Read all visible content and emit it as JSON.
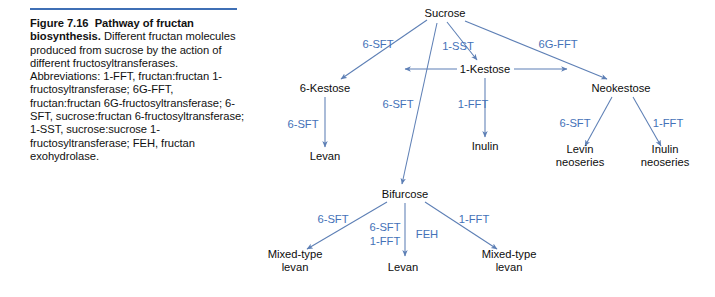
{
  "figure": {
    "rule_color": "#3f6fb5",
    "caption_label": "Figure 7.16",
    "caption_title": "Pathway of fructan biosynthesis.",
    "caption_body": " Different fructan molecules produced from sucrose by the action of different fructosyltransferases.\nAbbreviations: 1-FFT, fructan:fructan 1-fructosyltransferase; 6G-FFT, fructan:fructan 6G-fructosyltransferase; 6-SFT, sucrose:fructan 6-fructosyltransferase; 1-SST, sucrose:sucrose 1-fructosyltransferase; FEH, fructan exohydrolase."
  },
  "diagram": {
    "node_color": "#0d0d0d",
    "enzyme_color": "#4472b8",
    "arrow_color": "#5d7fb5",
    "nodes": [
      {
        "id": "sucrose",
        "label": "Sucrose",
        "x": 190,
        "y": 13
      },
      {
        "id": "six-kestose",
        "label": "6-Kestose",
        "x": 70,
        "y": 88
      },
      {
        "id": "one-kestose",
        "label": "1-Kestose",
        "x": 230,
        "y": 69
      },
      {
        "id": "neokestose",
        "label": "Neokestose",
        "x": 366,
        "y": 88
      },
      {
        "id": "levan-left",
        "label": "Levan",
        "x": 70,
        "y": 156
      },
      {
        "id": "inulin",
        "label": "Inulin",
        "x": 230,
        "y": 146
      },
      {
        "id": "levin-neoseries",
        "label": "Levin\nneoseries",
        "x": 325,
        "y": 156
      },
      {
        "id": "inulin-neoseries",
        "label": "Inulin\nneoseries",
        "x": 410,
        "y": 156
      },
      {
        "id": "bifurcose",
        "label": "Bifurcose",
        "x": 150,
        "y": 194
      },
      {
        "id": "mixed-levan-left",
        "label": "Mixed-type\nlevan",
        "x": 40,
        "y": 261
      },
      {
        "id": "levan-center",
        "label": "Levan",
        "x": 148,
        "y": 267
      },
      {
        "id": "mixed-levan-right",
        "label": "Mixed-type\nlevan",
        "x": 254,
        "y": 261
      }
    ],
    "enzymes": [
      {
        "id": "suc-to-6kestose",
        "label": "6-SFT",
        "x": 123,
        "y": 44
      },
      {
        "id": "suc-to-1kestose",
        "label": "1-SST",
        "x": 203,
        "y": 46
      },
      {
        "id": "suc-to-neokestose",
        "label": "6G-FFT",
        "x": 303,
        "y": 44
      },
      {
        "id": "6kestose-to-levan",
        "label": "6-SFT",
        "x": 48,
        "y": 124
      },
      {
        "id": "suc-to-bifurcose",
        "label": "6-SFT",
        "x": 143,
        "y": 104
      },
      {
        "id": "1kestose-to-inulin",
        "label": "1-FFT",
        "x": 218,
        "y": 104
      },
      {
        "id": "neo-to-levin",
        "label": "6-SFT",
        "x": 320,
        "y": 123
      },
      {
        "id": "neo-to-inulinneo",
        "label": "1-FFT",
        "x": 413,
        "y": 123
      },
      {
        "id": "bif-to-mixedleft",
        "label": "6-SFT",
        "x": 78,
        "y": 219
      },
      {
        "id": "bif-to-levan-a",
        "label": "6-SFT",
        "x": 130,
        "y": 227
      },
      {
        "id": "bif-to-levan-b",
        "label": "1-FFT",
        "x": 130,
        "y": 241
      },
      {
        "id": "bif-feh",
        "label": "FEH",
        "x": 172,
        "y": 234
      },
      {
        "id": "bif-to-mixedright",
        "label": "1-FFT",
        "x": 219,
        "y": 219
      }
    ]
  }
}
